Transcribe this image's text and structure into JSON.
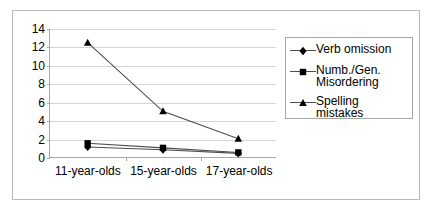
{
  "chart_data": {
    "type": "line",
    "title": "",
    "xlabel": "",
    "ylabel": "",
    "categories": [
      "11-year-olds",
      "15-year-olds",
      "17-year-olds"
    ],
    "ylim": [
      0,
      14
    ],
    "yticks": [
      0,
      2,
      4,
      6,
      8,
      10,
      12,
      14
    ],
    "grid": true,
    "legend_position": "right",
    "series": [
      {
        "name": "Verb omission",
        "marker": "diamond",
        "color": "#000000",
        "values": [
          1.1,
          0.8,
          0.4
        ]
      },
      {
        "name": "Numb./Gen. Misordering",
        "marker": "square",
        "color": "#000000",
        "values": [
          1.5,
          1.0,
          0.5
        ]
      },
      {
        "name": "Spelling mistakes",
        "marker": "triangle",
        "color": "#000000",
        "values": [
          12.5,
          5.0,
          2.0
        ]
      }
    ]
  },
  "legend": {
    "entries": [
      {
        "label": "Verb omission",
        "marker": "diamond-marker-icon"
      },
      {
        "label": "Numb./Gen.\nMisordering",
        "marker": "square-marker-icon"
      },
      {
        "label": "Spelling mistakes",
        "marker": "triangle-marker-icon"
      }
    ]
  },
  "axes": {
    "y_tick_labels": [
      "0",
      "2",
      "4",
      "6",
      "8",
      "10",
      "12",
      "14"
    ],
    "x_tick_labels": [
      "11-year-olds",
      "15-year-olds",
      "17-year-olds"
    ]
  },
  "colors": {
    "grid": "#d4d4d4",
    "axis": "#a6a6a6",
    "series": "#4d4d4d",
    "marker": "#000000",
    "frame": "#b8b8b8",
    "background": "#ffffff"
  }
}
